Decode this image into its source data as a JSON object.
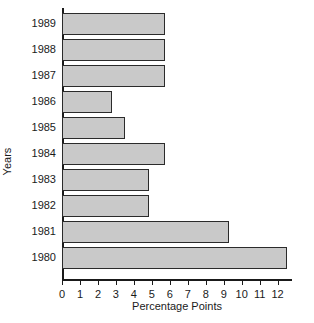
{
  "chart_data": {
    "type": "bar",
    "orientation": "horizontal",
    "title": "",
    "xlabel": "Percentage Points",
    "ylabel": "Years",
    "categories": [
      "1989",
      "1988",
      "1987",
      "1986",
      "1985",
      "1984",
      "1983",
      "1982",
      "1981",
      "1980"
    ],
    "values": [
      5.75,
      5.75,
      5.75,
      2.8,
      3.5,
      5.75,
      4.85,
      4.85,
      9.3,
      12.5
    ],
    "xlim": [
      0,
      12.8
    ],
    "xticks": [
      0,
      1,
      2,
      3,
      4,
      5,
      6,
      7,
      8,
      9,
      10,
      11,
      12
    ],
    "xtick_labels": [
      "0",
      "1",
      "2",
      "3",
      "4",
      "5",
      "6",
      "7",
      "8",
      "9",
      "10",
      "11",
      "12"
    ],
    "grid": false,
    "legend": null,
    "bar_fill_color": "#c9c9c9",
    "bar_edge_color": "#2b2b2b",
    "axis_color": "#1a1a1a",
    "background_color": "#ffffff"
  }
}
